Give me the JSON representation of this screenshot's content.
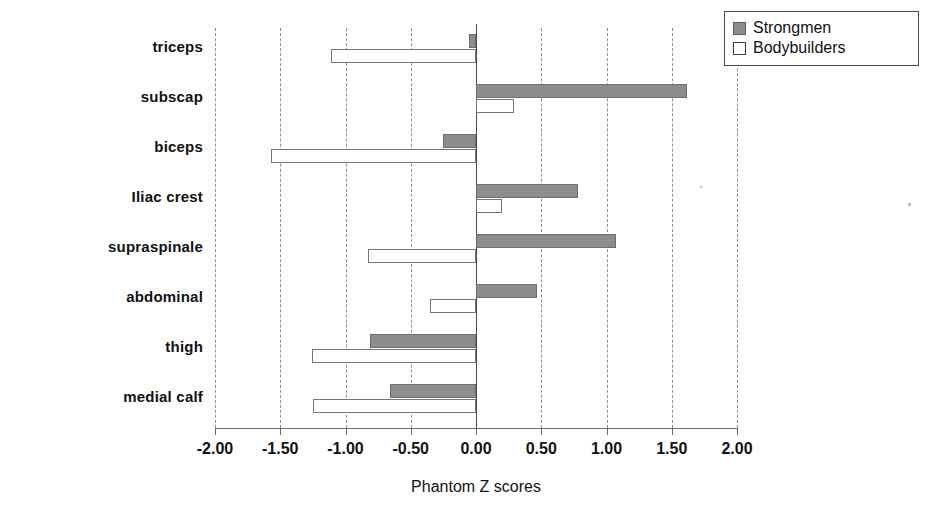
{
  "chart_data": {
    "type": "bar",
    "orientation": "horizontal",
    "title": "",
    "xlabel": "Phantom Z scores",
    "ylabel": "",
    "xlim": [
      -2.0,
      2.0
    ],
    "xticks": [
      -2.0,
      -1.5,
      -1.0,
      -0.5,
      0.0,
      0.5,
      1.0,
      1.5,
      2.0
    ],
    "xticklabels": [
      "-2.00",
      "-1.50",
      "-1.00",
      "-0.50",
      "0.00",
      "0.50",
      "1.00",
      "1.50",
      "2.00"
    ],
    "grid": "vertical dashed gridlines at every 0.50 tick",
    "legend_position": "top-right",
    "categories": [
      "triceps",
      "subscap",
      "biceps",
      "Iliac crest",
      "supraspinale",
      "abdominal",
      "thigh",
      "medial calf"
    ],
    "series": [
      {
        "name": "Strongmen",
        "color": "#8d8d8d",
        "style": "filled-gray",
        "values": [
          -0.05,
          1.62,
          -0.25,
          0.78,
          1.07,
          0.47,
          -0.81,
          -0.66
        ]
      },
      {
        "name": "Bodybuilders",
        "color": "#ffffff",
        "style": "white-outline",
        "values": [
          -1.11,
          0.29,
          -1.57,
          0.2,
          -0.83,
          -0.35,
          -1.26,
          -1.25
        ]
      }
    ]
  },
  "axis": {
    "title": "Phantom Z scores"
  },
  "legend": {
    "items": [
      {
        "label": "Strongmen",
        "swatch": "filled-square-icon"
      },
      {
        "label": "Bodybuilders",
        "swatch": "hollow-square-icon"
      }
    ]
  }
}
